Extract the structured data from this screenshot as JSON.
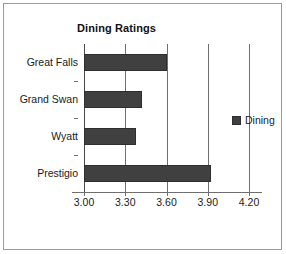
{
  "frame": {
    "border_color": "#9a9a9a",
    "background": "#ffffff"
  },
  "title": "Dining Ratings",
  "legend": {
    "position": "right",
    "entries": [
      {
        "label": "Dining",
        "color": "#404040",
        "icon": "square-swatch"
      }
    ]
  },
  "axis": {
    "tick_labels": [
      "3.00",
      "3.30",
      "3.60",
      "3.90",
      "4.20"
    ],
    "tick_values": [
      3.0,
      3.3,
      3.6,
      3.9,
      4.2
    ],
    "min": 3.0,
    "max": 4.2,
    "step": 0.3
  },
  "chart_data": {
    "type": "bar",
    "orientation": "horizontal",
    "title": "Dining Ratings",
    "xlabel": "",
    "ylabel": "",
    "categories": [
      "Great Falls",
      "Grand Swan",
      "Wyatt",
      "Prestigio"
    ],
    "series": [
      {
        "name": "Dining",
        "color": "#404040",
        "values": [
          3.6,
          3.42,
          3.38,
          3.92
        ]
      }
    ],
    "xlim": [
      3.0,
      4.2
    ],
    "xticks": [
      3.0,
      3.3,
      3.6,
      3.9,
      4.2
    ],
    "xticklabels": [
      "3.00",
      "3.30",
      "3.60",
      "3.90",
      "4.20"
    ],
    "grid": "vertical",
    "legend_position": "right"
  }
}
